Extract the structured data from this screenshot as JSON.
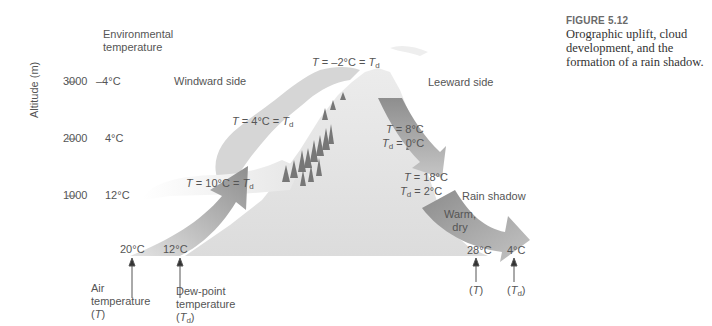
{
  "figure": {
    "number": "FIGURE 5.12",
    "caption": "Orographic uplift, cloud development, and the formation of a rain shadow."
  },
  "axis": {
    "ylabel": "Altitude (m)",
    "header": "Environmental temperature",
    "header_line1": "Environmental",
    "header_line2": "temperature",
    "ticks": [
      {
        "altitude": "3000",
        "temp": "–4°C"
      },
      {
        "altitude": "2000",
        "temp": "4°C"
      },
      {
        "altitude": "1000",
        "temp": "12°C"
      }
    ]
  },
  "sides": {
    "windward": "Windward side",
    "leeward": "Leeward side",
    "rain_shadow": "Rain shadow"
  },
  "windward_labels": {
    "top": {
      "T": "T",
      "text": " = –2°C = ",
      "Td": "T",
      "sub": "d"
    },
    "mid": {
      "T": "T",
      "text": " = 4°C = ",
      "Td": "T",
      "sub": "d"
    },
    "low": {
      "T": "T",
      "text": " = 10°C = ",
      "Td": "T",
      "sub": "d"
    }
  },
  "leeward_labels": {
    "upper_T": " = 8°C",
    "upper_Td": " = 0°C",
    "lower_T": " = 18°C",
    "lower_Td": " = 2°C"
  },
  "arrow_text": {
    "warm": "Warm,",
    "dry": "dry"
  },
  "base": {
    "air_temp_value": "20°C",
    "dew_temp_value": "12°C",
    "lee_air_value": "28°C",
    "lee_dew_value": "4°C",
    "air_label_1": "Air",
    "air_label_2": "temperature",
    "air_label_3": "(T)",
    "dew_label_1": "Dew-point",
    "dew_label_2": "temperature",
    "dew_label_3": "(Td)",
    "lee_T": "(T)",
    "lee_Td": "(Td)"
  },
  "colors": {
    "arrow_dark": "#8a8a8a",
    "arrow_light": "#c8c8c8",
    "mountain": "#e2e2e2",
    "cloud": "#d4d4d4",
    "tree": "#7a7a7a"
  }
}
